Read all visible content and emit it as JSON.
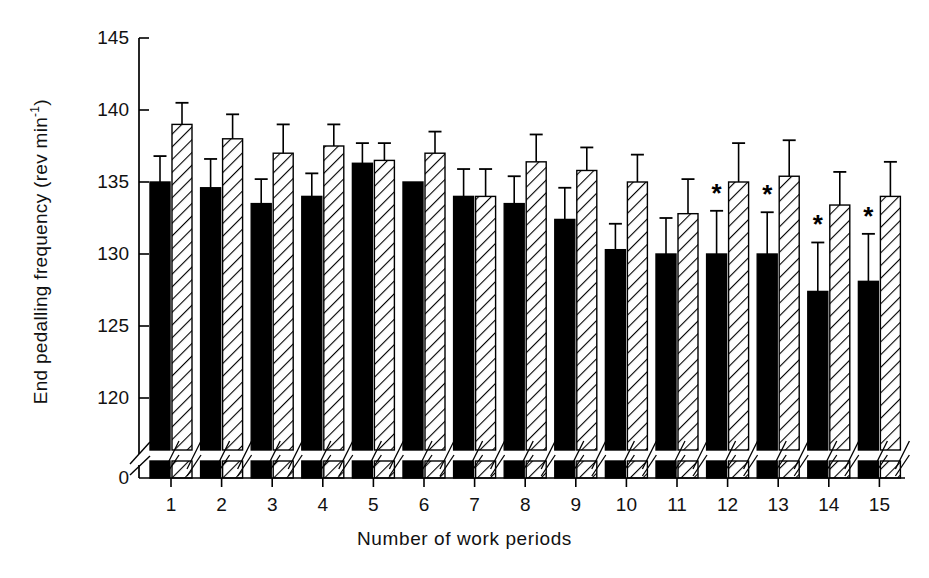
{
  "chart_data": {
    "type": "bar",
    "title": "",
    "xlabel": "Number of work periods",
    "ylabel": "End pedalling frequency (rev min-1)",
    "ylabel_base": "End pedalling frequency (rev min",
    "ylabel_exponent": "-1",
    "ylabel_close": ")",
    "categories": [
      "1",
      "2",
      "3",
      "4",
      "5",
      "6",
      "7",
      "8",
      "9",
      "10",
      "11",
      "12",
      "13",
      "14",
      "15"
    ],
    "ytick_labels": [
      "0",
      "120",
      "125",
      "130",
      "135",
      "140",
      "145"
    ],
    "ylim": [
      120,
      145
    ],
    "axis_break": true,
    "axis_break_note": "y-axis broken between 0 and 120",
    "grid": false,
    "legend": "none",
    "series": [
      {
        "name": "black",
        "fill": "solid-black",
        "values": [
          135.0,
          134.6,
          133.5,
          134.0,
          136.3,
          135.0,
          134.0,
          133.5,
          132.4,
          130.3,
          130.0,
          130.0,
          130.0,
          127.4,
          128.1
        ],
        "errors": [
          1.8,
          2.0,
          1.7,
          1.6,
          1.4,
          0.0,
          1.9,
          1.9,
          2.2,
          1.8,
          2.5,
          3.0,
          2.9,
          3.4,
          3.3
        ]
      },
      {
        "name": "hatched",
        "fill": "diagonal-hatch",
        "values": [
          139.0,
          138.0,
          137.0,
          137.5,
          136.5,
          137.0,
          134.0,
          136.4,
          135.8,
          135.0,
          132.8,
          135.0,
          135.4,
          133.4,
          134.0
        ],
        "errors": [
          1.5,
          1.7,
          2.0,
          1.5,
          1.2,
          1.5,
          1.9,
          1.9,
          1.6,
          1.9,
          2.4,
          2.7,
          2.5,
          2.3,
          2.4
        ]
      }
    ],
    "significance_marker": "*",
    "significance_on": [
      12,
      13,
      14,
      15
    ],
    "significance_series": "black"
  }
}
